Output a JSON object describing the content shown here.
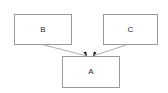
{
  "diagram": {
    "type": "block-relationship-diagram",
    "background_color": "#ffffff",
    "node_fill_color": "#ffffff",
    "node_border_color": "#9a9a9a",
    "edge_color": "#8c8c8c",
    "arrowhead_color": "#1a1a1a",
    "label_color": "#2b2b2b",
    "nodes": [
      {
        "id": "B",
        "label": "B",
        "x": 14,
        "y": 14,
        "width": 58,
        "height": 31
      },
      {
        "id": "C",
        "label": "C",
        "x": 103,
        "y": 14,
        "width": 55,
        "height": 31
      },
      {
        "id": "A",
        "label": "A",
        "x": 62,
        "y": 56,
        "width": 58,
        "height": 32
      }
    ],
    "edges": [
      {
        "id": "edge-b-a",
        "from": "B",
        "to": "A",
        "from_x": 44,
        "from_y": 45,
        "to_x": 87,
        "to_y": 56,
        "arrowhead": "filled-triangle",
        "label": ""
      },
      {
        "id": "edge-c-a",
        "from": "C",
        "to": "A",
        "from_x": 126,
        "from_y": 45,
        "to_x": 93,
        "to_y": 56,
        "arrowhead": "filled-triangle",
        "label": ""
      }
    ]
  }
}
